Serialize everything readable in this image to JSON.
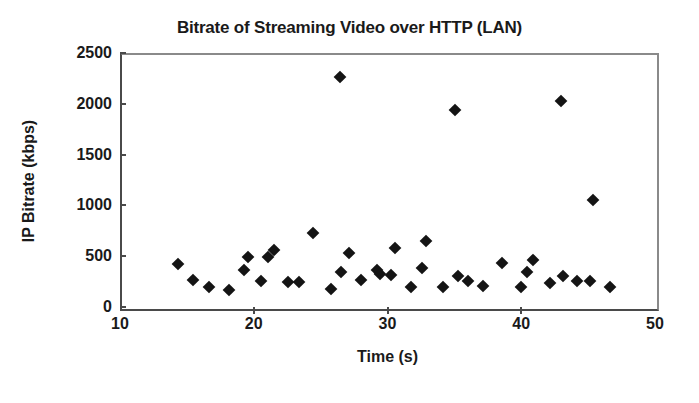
{
  "chart_data": {
    "type": "scatter",
    "title": "Bitrate of Streaming Video over HTTP (LAN)",
    "xlabel": "Time (s)",
    "ylabel": "IP Bitrate (kbps)",
    "xlim": [
      10,
      50
    ],
    "ylim": [
      0,
      2500
    ],
    "xticks": [
      10,
      20,
      30,
      40,
      50
    ],
    "yticks": [
      0,
      500,
      1000,
      1500,
      2000,
      2500
    ],
    "grid": false,
    "legend": null,
    "marker": "diamond",
    "marker_color": "#141414",
    "series": [
      {
        "name": "IP Bitrate",
        "points": [
          [
            14.2,
            440
          ],
          [
            15.3,
            290
          ],
          [
            16.5,
            215
          ],
          [
            18.0,
            185
          ],
          [
            19.1,
            380
          ],
          [
            19.4,
            510
          ],
          [
            20.4,
            275
          ],
          [
            20.9,
            510
          ],
          [
            21.4,
            585
          ],
          [
            22.4,
            270
          ],
          [
            23.2,
            270
          ],
          [
            24.3,
            750
          ],
          [
            25.6,
            200
          ],
          [
            26.3,
            2280
          ],
          [
            26.4,
            365
          ],
          [
            27.0,
            555
          ],
          [
            27.9,
            290
          ],
          [
            29.1,
            380
          ],
          [
            29.3,
            345
          ],
          [
            30.1,
            330
          ],
          [
            30.4,
            600
          ],
          [
            31.6,
            215
          ],
          [
            32.4,
            405
          ],
          [
            32.7,
            670
          ],
          [
            34.0,
            215
          ],
          [
            34.9,
            1955
          ],
          [
            35.1,
            320
          ],
          [
            35.9,
            275
          ],
          [
            37.0,
            230
          ],
          [
            38.4,
            455
          ],
          [
            39.8,
            215
          ],
          [
            40.3,
            365
          ],
          [
            40.7,
            485
          ],
          [
            42.0,
            260
          ],
          [
            42.8,
            2045
          ],
          [
            43.0,
            325
          ],
          [
            44.0,
            280
          ],
          [
            45.0,
            280
          ],
          [
            45.2,
            1075
          ],
          [
            46.5,
            220
          ]
        ]
      }
    ]
  },
  "axis": {
    "y_tick_labels": [
      "2500",
      "2000",
      "1500",
      "1000",
      "500",
      "0"
    ],
    "x_tick_labels": [
      "10",
      "20",
      "30",
      "40",
      "50"
    ]
  }
}
